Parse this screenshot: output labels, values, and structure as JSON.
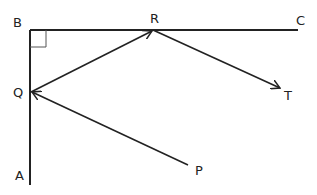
{
  "diagram": {
    "points": {
      "B": {
        "label": "B",
        "x": 30,
        "y": 30
      },
      "C": {
        "label": "C",
        "x": 298,
        "y": 30
      },
      "R": {
        "label": "R",
        "x": 153,
        "y": 30
      },
      "Q": {
        "label": "Q",
        "x": 31,
        "y": 92
      },
      "A": {
        "label": "A",
        "x": 30,
        "y": 185
      },
      "P": {
        "label": "P",
        "x": 188,
        "y": 165
      },
      "T": {
        "label": "T",
        "x": 280,
        "y": 90
      }
    },
    "segments": [
      "B-C",
      "B-A"
    ],
    "arrows": [
      "P->Q",
      "Q->R",
      "R->T"
    ],
    "right_angle_at": "B",
    "stroke_color": "#222222"
  }
}
